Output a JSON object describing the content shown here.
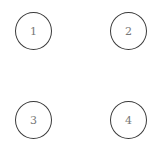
{
  "diagram": {
    "type": "nodes",
    "nodes": [
      {
        "id": "1",
        "label": "1",
        "cx": 34,
        "cy": 31
      },
      {
        "id": "2",
        "label": "2",
        "cx": 129,
        "cy": 31
      },
      {
        "id": "3",
        "label": "3",
        "cx": 34,
        "cy": 120
      },
      {
        "id": "4",
        "label": "4",
        "cx": 129,
        "cy": 120
      }
    ],
    "edges": [],
    "colors": {
      "stroke": "#3a3a3a",
      "label": "#777777",
      "background": "#ffffff"
    }
  }
}
